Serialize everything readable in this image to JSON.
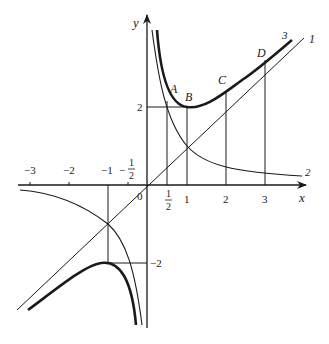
{
  "figure": {
    "type": "function-graph",
    "axes": {
      "x_label": "x",
      "y_label": "y",
      "origin_label": "0",
      "x_ticks": [
        {
          "value": -3,
          "label": "−3"
        },
        {
          "value": -2,
          "label": "−2"
        },
        {
          "value": -1,
          "label": "−1"
        },
        {
          "value": -0.5,
          "label_sign": "−",
          "label_num": "1",
          "label_den": "2"
        },
        {
          "value": 0.5,
          "label_num": "1",
          "label_den": "2"
        },
        {
          "value": 1,
          "label": "1"
        },
        {
          "value": 2,
          "label": "2"
        },
        {
          "value": 3,
          "label": "3"
        }
      ],
      "y_ticks": [
        {
          "value": 2,
          "label": "2"
        },
        {
          "value": -2,
          "label": "−2"
        }
      ]
    },
    "curves": [
      {
        "id": "1",
        "label": "1",
        "equation": "y = x",
        "style": "thin"
      },
      {
        "id": "2",
        "label": "2",
        "equation": "y = 1/x",
        "style": "thin"
      },
      {
        "id": "3",
        "label": "3",
        "equation": "y = x + 1/x",
        "style": "thick"
      }
    ],
    "points": [
      {
        "label": "A",
        "x": 0.5
      },
      {
        "label": "B",
        "x": 1
      },
      {
        "label": "C",
        "x": 2
      },
      {
        "label": "D",
        "x": 3
      }
    ]
  }
}
